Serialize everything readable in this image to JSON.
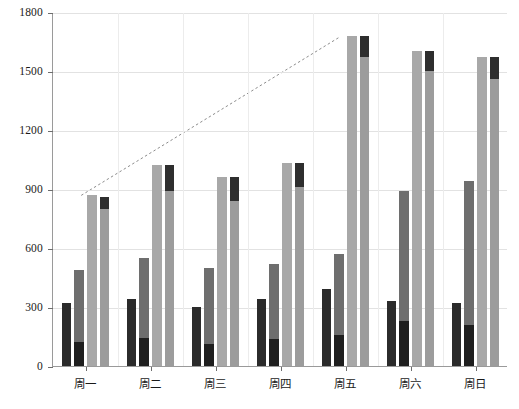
{
  "chart_data": {
    "type": "bar",
    "title": "",
    "subtitle": "",
    "xlabel": "",
    "ylabel": "",
    "grid": true,
    "legend": "none",
    "ylim": [
      0,
      1800
    ],
    "yticks": [
      0,
      300,
      600,
      900,
      1200,
      1500,
      1800
    ],
    "ytick_labels": [
      "0",
      "300",
      "600",
      "900",
      "1200",
      "1500",
      "1800"
    ],
    "categories": [
      "周一",
      "周二",
      "周三",
      "周四",
      "周五",
      "周六",
      "周日"
    ],
    "series": [
      {
        "name": "series-1",
        "color": "#2b2b2b",
        "stacked": false,
        "values": [
          320,
          340,
          300,
          340,
          390,
          330,
          320
        ]
      },
      {
        "name": "series-2",
        "color": "#6e6e6e",
        "stacked": true,
        "base_color": "#1f1f1f",
        "values": [
          490,
          550,
          500,
          520,
          570,
          890,
          940
        ],
        "base_values": [
          120,
          140,
          110,
          135,
          160,
          230,
          210
        ]
      },
      {
        "name": "series-3",
        "color": "#a8a8a8",
        "stacked": false,
        "values": [
          870,
          1020,
          960,
          1030,
          1680,
          1600,
          1570
        ]
      },
      {
        "name": "series-4",
        "color": "#9c9c9c",
        "stacked": true,
        "top_color": "#2e2e2e",
        "values": [
          860,
          1020,
          960,
          1030,
          1680,
          1600,
          1570
        ],
        "top_values": [
          60,
          130,
          120,
          120,
          110,
          100,
          110
        ]
      }
    ],
    "annotations": [
      {
        "type": "dashed-line",
        "name": "trend-line",
        "from": {
          "category": "周一",
          "y": 870
        },
        "to": {
          "category": "周五",
          "y": 1680
        },
        "color": "#8c8c8c",
        "style": "dashed"
      }
    ]
  },
  "axes": {
    "y_axis_name": "y-axis",
    "x_axis_name": "x-axis"
  }
}
